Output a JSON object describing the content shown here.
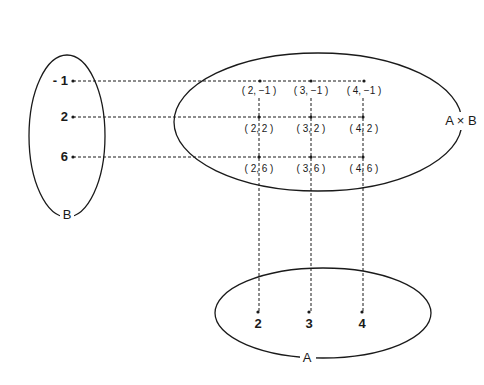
{
  "diagram": {
    "colors": {
      "stroke": "#1a1a1a",
      "background": "#ffffff"
    },
    "sets": {
      "B": {
        "label": "B",
        "elements": [
          "- 1",
          "2",
          "6"
        ]
      },
      "A": {
        "label": "A",
        "elements": [
          "2",
          "3",
          "4"
        ]
      },
      "AxB": {
        "label": "A × B",
        "pairs": [
          [
            "( 2, −1 )",
            "( 3, −1 )",
            "( 4, −1 )"
          ],
          [
            "( 2, 2 )",
            "( 3, 2 )",
            "( 4, 2 )"
          ],
          [
            "( 2, 6 )",
            "( 3, 6 )",
            "( 4, 6 )"
          ]
        ]
      }
    }
  }
}
